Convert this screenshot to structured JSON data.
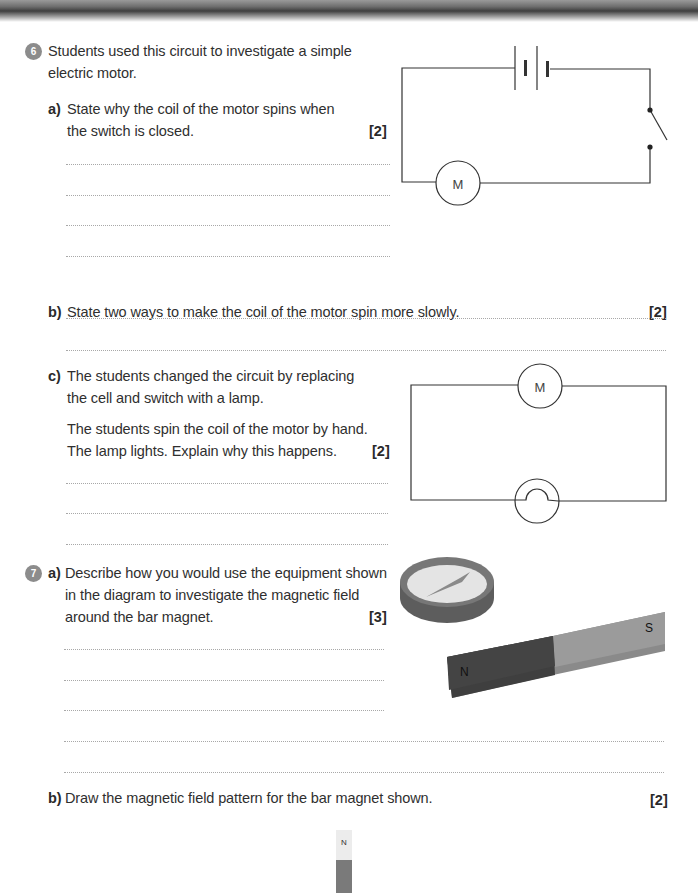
{
  "questions": [
    {
      "number": "6",
      "intro": [
        "Students used this circuit to investigate a simple",
        "electric motor."
      ],
      "parts": {
        "a": {
          "label": "a)",
          "text": [
            "State why the coil of the motor spins when",
            "the switch is closed."
          ],
          "marks": "[2]",
          "answer_lines": 4
        },
        "b": {
          "label": "b)",
          "text": [
            "State two ways to make the coil of the motor spin more slowly."
          ],
          "marks": "[2]",
          "answer_lines": 2
        },
        "c": {
          "label": "c)",
          "text": [
            "The students changed the circuit by replacing",
            "the cell and switch with a lamp."
          ],
          "text2": [
            "The students spin the coil of the motor by hand.",
            "The lamp lights. Explain why this happens."
          ],
          "marks": "[2]",
          "answer_lines": 3
        }
      },
      "diagrams": {
        "circuit1": {
          "components": [
            "cell",
            "switch (open)",
            "motor"
          ],
          "motor_label": "M"
        },
        "circuit2": {
          "components": [
            "motor",
            "lamp"
          ],
          "motor_label": "M"
        }
      }
    },
    {
      "number": "7",
      "parts": {
        "a": {
          "label": "a)",
          "text": [
            "Describe how you would use the equipment shown",
            "in the diagram to investigate the magnetic field",
            "around the bar magnet."
          ],
          "marks": "[3]",
          "answer_lines": 5
        },
        "b": {
          "label": "b)",
          "text": [
            "Draw the magnetic field pattern for the bar magnet shown."
          ],
          "marks": "[2]"
        }
      },
      "diagrams": {
        "equipment": {
          "items": [
            "plotting compass",
            "bar magnet"
          ],
          "north_label": "N",
          "south_label": "S"
        },
        "vertical_magnet": {
          "north_label": "N"
        }
      }
    }
  ]
}
